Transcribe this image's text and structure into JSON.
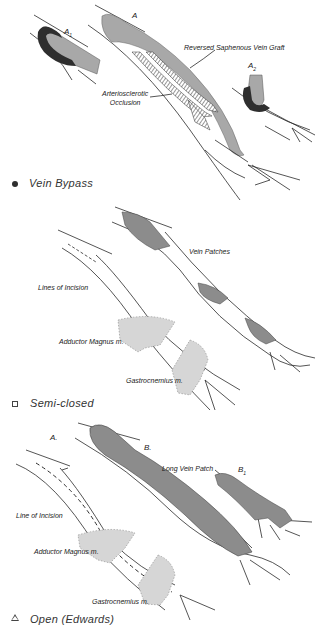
{
  "panels": [
    {
      "id": "vein-bypass",
      "caption": "Vein Bypass",
      "marker": "filled-circle",
      "labels": {
        "a1": "A",
        "a1_sub": "1",
        "a": "A",
        "a2": "A",
        "a2_sub": "2",
        "graft": "Reversed Saphenous Vein Graft",
        "occlusion_line1": "Arteriosclerotic",
        "occlusion_line2": "Occlusion"
      }
    },
    {
      "id": "semi-closed",
      "caption": "Semi-closed",
      "marker": "open-square",
      "labels": {
        "vein_patches": "Vein Patches",
        "incision": "Lines of Incision",
        "adductor": "Adductor Magnus m.",
        "gastrocnemius": "Gastrocnemius m."
      }
    },
    {
      "id": "open-edwards",
      "caption": "Open (Edwards)",
      "marker": "open-triangle",
      "labels": {
        "a": "A.",
        "b": "B.",
        "b1": "B",
        "b1_sub": "1",
        "long_patch": "Long Vein Patch",
        "incision": "Line of Incision",
        "adductor": "Adductor Magnus m.",
        "gastrocnemius": "Gastrocnemius m."
      }
    }
  ],
  "colors": {
    "line": "#2a2a2a",
    "vein_fill": "#a8a8a8",
    "patch_fill": "#8c8c8c",
    "dark_fill": "#2e2e2e",
    "muscle_fill": "#d6d6d6"
  }
}
